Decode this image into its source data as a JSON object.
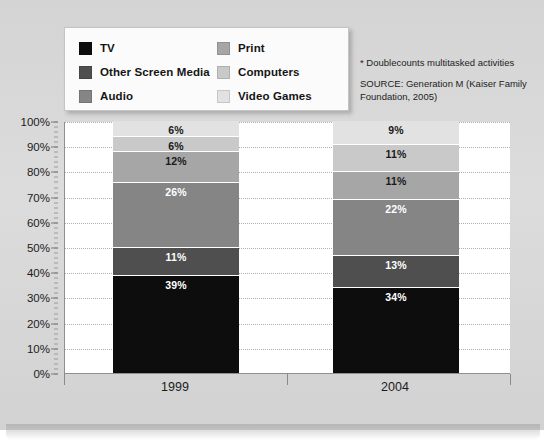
{
  "chart_data": {
    "type": "bar",
    "subtype": "stacked-100-percent",
    "title": "",
    "xlabel": "",
    "ylabel": "",
    "ylim": [
      0,
      100
    ],
    "ytick_labels": [
      "0%",
      "10%",
      "20%",
      "30%",
      "40%",
      "50%",
      "60%",
      "70%",
      "80%",
      "90%",
      "100%"
    ],
    "ytick_values": [
      0,
      10,
      20,
      30,
      40,
      50,
      60,
      70,
      80,
      90,
      100
    ],
    "grid": true,
    "legend_position": "top-left",
    "categories": [
      "1999",
      "2004"
    ],
    "series": [
      {
        "name": "TV",
        "color": "#0d0d0d",
        "label_color": "#ffffff",
        "values": [
          39,
          34
        ],
        "value_labels": [
          "39%",
          "34%"
        ]
      },
      {
        "name": "Other Screen Media",
        "color": "#4f4f4f",
        "label_color": "#ffffff",
        "values": [
          11,
          13
        ],
        "value_labels": [
          "11%",
          "13%"
        ]
      },
      {
        "name": "Audio",
        "color": "#858585",
        "label_color": "#ffffff",
        "values": [
          26,
          22
        ],
        "value_labels": [
          "26%",
          "22%"
        ]
      },
      {
        "name": "Print",
        "color": "#a6a6a6",
        "label_color": "#1a1a1a",
        "values": [
          12,
          11
        ],
        "value_labels": [
          "12%",
          "11%"
        ]
      },
      {
        "name": "Computers",
        "color": "#c9c9c9",
        "label_color": "#1a1a1a",
        "values": [
          6,
          11
        ],
        "value_labels": [
          "6%",
          "11%"
        ]
      },
      {
        "name": "Video Games",
        "color": "#e2e2e2",
        "label_color": "#1a1a1a",
        "values": [
          6,
          9
        ],
        "value_labels": [
          "6%",
          "9%"
        ]
      }
    ],
    "annotations": [
      "* Doublecounts multitasked activities",
      "SOURCE: Generation M (Kaiser Family",
      "Foundation, 2005)"
    ]
  },
  "legend": {
    "left_column": [
      {
        "label": "TV",
        "color": "#0d0d0d"
      },
      {
        "label": "Other Screen Media",
        "color": "#4f4f4f"
      },
      {
        "label": "Audio",
        "color": "#858585"
      }
    ],
    "right_column": [
      {
        "label": "Print",
        "color": "#a6a6a6"
      },
      {
        "label": "Computers",
        "color": "#c9c9c9"
      },
      {
        "label": "Video Games",
        "color": "#e2e2e2"
      }
    ]
  },
  "notes": {
    "footnote": "* Doublecounts multitasked activities",
    "source_line1": "SOURCE: Generation M (Kaiser Family",
    "source_line2": "Foundation, 2005)"
  }
}
